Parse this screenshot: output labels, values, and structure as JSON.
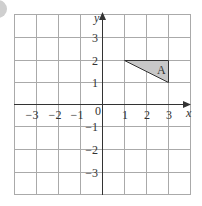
{
  "diagram": {
    "type": "coordinate-grid",
    "x_axis_label": "x",
    "y_axis_label": "y",
    "origin_label": "0",
    "x_ticks": [
      {
        "value": -3,
        "label": "−3"
      },
      {
        "value": -2,
        "label": "−2"
      },
      {
        "value": -1,
        "label": "−1"
      },
      {
        "value": 1,
        "label": "1"
      },
      {
        "value": 2,
        "label": "2"
      },
      {
        "value": 3,
        "label": "3"
      }
    ],
    "y_ticks": [
      {
        "value": 3,
        "label": "3"
      },
      {
        "value": 2,
        "label": "2"
      },
      {
        "value": 1,
        "label": "1"
      },
      {
        "value": -1,
        "label": "−1"
      },
      {
        "value": -2,
        "label": "−2"
      },
      {
        "value": -3,
        "label": "−3"
      }
    ],
    "shape": {
      "label": "A",
      "vertices": [
        [
          1,
          2
        ],
        [
          3,
          2
        ],
        [
          3,
          1
        ]
      ],
      "fill": "#c8c8c8"
    },
    "colors": {
      "grid": "#aaaaaa",
      "axis": "#333333",
      "badge": "#cfcfcf"
    }
  }
}
